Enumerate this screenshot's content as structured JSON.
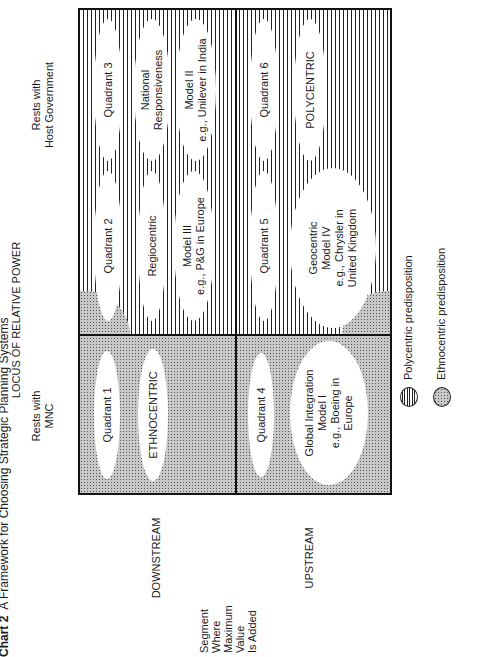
{
  "title": {
    "chart_number": "Chart 2",
    "text": "A Framework for Choosing Strategic Planning Systems"
  },
  "axes": {
    "power_axis_label": "LOCUS OF RELATIVE POWER",
    "power_left": "Rests with\nMNC",
    "power_right": "Rests with\nHost Government",
    "segment_axis_label": "Segment\nWhere\nMaximum\nValue\nIs Added",
    "segment_top": "DOWNSTREAM",
    "segment_bottom": "UPSTREAM"
  },
  "quadrants": [
    {
      "name": "Quadrant 1",
      "orientation": "ETHNOCENTRIC",
      "model": "",
      "example": ""
    },
    {
      "name": "Quadrant 2",
      "orientation": "Regiocentric",
      "model": "Model III",
      "example": "e.g., P&G in Europe"
    },
    {
      "name": "Quadrant 3",
      "orientation": "National\nResponsiveness",
      "model": "Model II",
      "example": "e.g., Unilever in India"
    },
    {
      "name": "Quadrant 4",
      "orientation": "Global Integration",
      "model": "Model I",
      "example": "e.g., Boeing in\nEurope"
    },
    {
      "name": "Quadrant 5",
      "orientation": "Geocentric",
      "model": "Model IV",
      "example": "e.g., Chrysler in\nUnited Kingdom"
    },
    {
      "name": "Quadrant 6",
      "orientation": "POLYCENTRIC",
      "model": "",
      "example": ""
    }
  ],
  "legend": [
    {
      "pattern": "vertical-lines",
      "label": "Polycentric predisposition"
    },
    {
      "pattern": "dots",
      "label": "Ethnocentric predisposition"
    }
  ],
  "colors": {
    "line": "#111111",
    "dot_fill": "#c8c8c8",
    "background": "#ffffff"
  }
}
